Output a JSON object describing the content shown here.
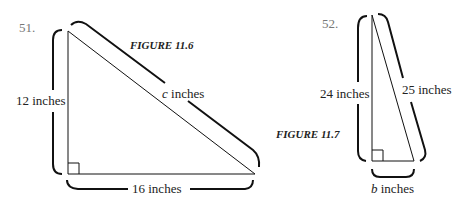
{
  "problems": [
    {
      "number": "51.",
      "figure_caption": "FIGURE 11.6",
      "legs": {
        "vertical": "12 inches",
        "horizontal": "16 inches"
      },
      "hypotenuse": "c inches",
      "hypotenuse_var": "c",
      "hypotenuse_unit": " inches"
    },
    {
      "number": "52.",
      "figure_caption": "FIGURE 11.7",
      "legs": {
        "vertical": "24 inches",
        "horizontal": "b inches"
      },
      "horizontal_var": "b",
      "horizontal_unit": " inches",
      "hypotenuse": "25 inches"
    }
  ],
  "colors": {
    "line": "#111111",
    "number": "#777777"
  }
}
